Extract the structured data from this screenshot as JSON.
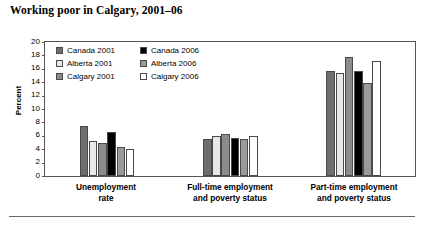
{
  "chart_data": {
    "type": "bar",
    "title": "Working poor in Calgary, 2001–06",
    "xlabel": "",
    "ylabel": "Percent",
    "ylim": [
      0,
      20
    ],
    "ytick_step": 2,
    "yticks": [
      "20",
      "18",
      "16",
      "14",
      "12",
      "10",
      "8",
      "6",
      "4",
      "2",
      "0"
    ],
    "grid": false,
    "legend_position": "inside-top-left",
    "categories": [
      "Unemployment rate",
      "Full-time employment and poverty status",
      "Part-time employment and poverty status"
    ],
    "category_lines": [
      [
        "Unemployment",
        "rate"
      ],
      [
        "Full-time employment",
        "and poverty status"
      ],
      [
        "Part-time employment",
        "and poverty status"
      ]
    ],
    "series": [
      {
        "name": "Canada 2001",
        "color": "#6e6e6e",
        "values": [
          7.4,
          5.5,
          15.7
        ]
      },
      {
        "name": "Alberta 2001",
        "color": "#e8e8e8",
        "values": [
          5.2,
          6.0,
          15.4
        ]
      },
      {
        "name": "Calgary 2001",
        "color": "#8c8c8c",
        "values": [
          5.0,
          6.2,
          17.8
        ]
      },
      {
        "name": "Canada 2006",
        "color": "#000000",
        "values": [
          6.5,
          5.7,
          15.7
        ]
      },
      {
        "name": "Alberta 2006",
        "color": "#9a9a9a",
        "values": [
          4.3,
          5.5,
          13.9
        ]
      },
      {
        "name": "Calgary 2006",
        "color": "#ffffff",
        "values": [
          4.1,
          6.0,
          17.2
        ]
      }
    ]
  },
  "legend": {
    "entries": [
      {
        "label": "Canada 2001",
        "color": "#6e6e6e"
      },
      {
        "label": "Canada 2006",
        "color": "#000000"
      },
      {
        "label": "Alberta 2001",
        "color": "#e8e8e8"
      },
      {
        "label": "Alberta 2006",
        "color": "#9a9a9a"
      },
      {
        "label": "Calgary 2001",
        "color": "#8c8c8c"
      },
      {
        "label": "Calgary 2006",
        "color": "#ffffff"
      }
    ]
  },
  "style": {
    "axis_color": "#555555",
    "bar_outline": "#4a4a4a",
    "background": "#ffffff",
    "text_color": "#000000"
  }
}
